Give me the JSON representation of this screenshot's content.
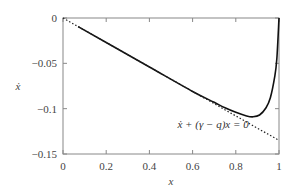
{
  "chart_data": {
    "type": "line",
    "title": "",
    "xlabel": "x",
    "ylabel": "ẋ",
    "xlim": [
      0,
      1
    ],
    "ylim": [
      -0.15,
      0
    ],
    "xticks": [
      "0",
      "0.2",
      "0.4",
      "0.6",
      "0.8",
      "1"
    ],
    "yticks": [
      "0",
      "−0.05",
      "−0.1",
      "−0.15"
    ],
    "grid": false,
    "legend": null,
    "series": [
      {
        "name": "solution curve",
        "style": "solid",
        "x": [
          0.07,
          0.2,
          0.4,
          0.6,
          0.7,
          0.75,
          0.8,
          0.85,
          0.88,
          0.91,
          0.94,
          0.96,
          0.98,
          0.99,
          1.0
        ],
        "y": [
          -0.0095,
          -0.027,
          -0.054,
          -0.081,
          -0.093,
          -0.099,
          -0.104,
          -0.108,
          -0.109,
          -0.107,
          -0.099,
          -0.088,
          -0.065,
          -0.045,
          0.0
        ]
      },
      {
        "name": "ẋ + (γ − q)x = 0",
        "style": "dotted",
        "x": [
          0,
          1
        ],
        "y": [
          0,
          -0.135
        ]
      }
    ],
    "annotations": [
      {
        "text": "ẋ + (γ − q)x = 0",
        "x": 0.53,
        "y": -0.121
      }
    ]
  }
}
